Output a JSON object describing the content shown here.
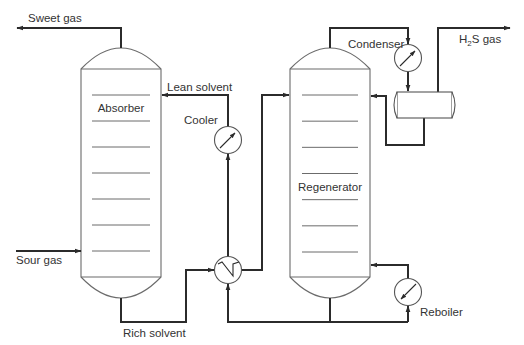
{
  "diagram": {
    "units": {
      "absorber": {
        "label": "Absorber",
        "tray_count": 7
      },
      "regenerator": {
        "label": "Regenerator",
        "tray_count": 7
      },
      "cooler": {
        "label": "Cooler"
      },
      "condenser": {
        "label": "Condenser"
      },
      "reboiler": {
        "label": "Reboiler"
      },
      "heat_exchanger": {
        "label": ""
      },
      "reflux_drum": {
        "label": ""
      }
    },
    "streams": {
      "sweet_gas": "Sweet gas",
      "sour_gas": "Sour gas",
      "lean_solvent": "Lean solvent",
      "rich_solvent": "Rich solvent",
      "h2s_gas_main": "H",
      "h2s_gas_sub": "2",
      "h2s_gas_tail": "S gas"
    },
    "colors": {
      "pipe": "#2b2b2b",
      "vessel_outline": "#6b6b6b",
      "text": "#333333",
      "background": "#ffffff"
    }
  }
}
